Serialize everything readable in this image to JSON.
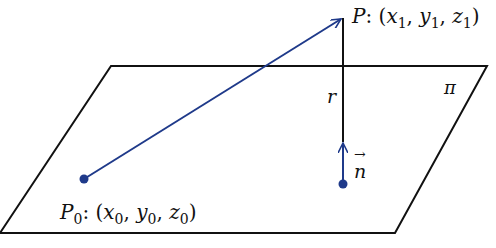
{
  "diagram": {
    "colors": {
      "line": "#111111",
      "vector": "#1f3a8a",
      "background": "#ffffff"
    },
    "plane": {
      "label": "π",
      "points": [
        [
          111,
          66
        ],
        [
          487,
          66
        ],
        [
          395,
          233
        ],
        [
          0,
          233
        ]
      ]
    },
    "point_p0": {
      "name": "P",
      "sub": "0",
      "colon": ":",
      "coords": [
        {
          "v": "x",
          "s": "0"
        },
        {
          "v": "y",
          "s": "0"
        },
        {
          "v": "z",
          "s": "0"
        }
      ],
      "pos": [
        84,
        179
      ]
    },
    "point_p": {
      "name": "P",
      "colon": ":",
      "coords": [
        {
          "v": "x",
          "s": "1"
        },
        {
          "v": "y",
          "s": "1"
        },
        {
          "v": "z",
          "s": "1"
        }
      ],
      "pos": [
        343,
        17
      ]
    },
    "segment_r": {
      "label": "r"
    },
    "normal": {
      "label": "n",
      "arrow": "→"
    }
  }
}
